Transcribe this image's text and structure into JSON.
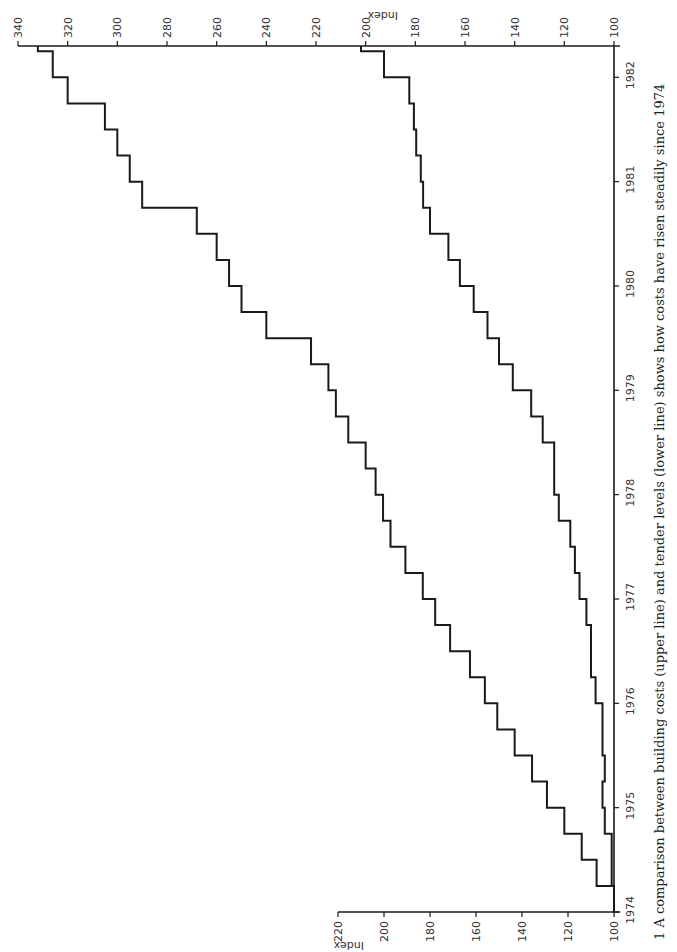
{
  "chart_data": {
    "type": "line",
    "step": true,
    "orientation": "rotated-90-ccw",
    "title": "",
    "caption": "1 A comparison between building costs (upper line) and tender levels (lower line) shows how costs have risen steadily since 1974",
    "xlabel": "",
    "ylabel": "Index",
    "x_ticks": [
      "1974",
      "1975",
      "1976",
      "1977",
      "1978",
      "1979",
      "1980",
      "1981",
      "1982"
    ],
    "upper_axis": {
      "label": "Index",
      "range": [
        100,
        340
      ],
      "ticks": [
        100,
        120,
        140,
        160,
        180,
        200,
        220,
        240,
        260,
        280,
        300,
        320,
        340
      ]
    },
    "lower_axis": {
      "label": "Index",
      "range": [
        100,
        220
      ],
      "ticks": [
        100,
        120,
        140,
        160,
        180,
        200,
        220
      ]
    },
    "x": [
      1974.0,
      1974.25,
      1974.5,
      1974.75,
      1975.0,
      1975.25,
      1975.5,
      1975.75,
      1976.0,
      1976.25,
      1976.5,
      1976.75,
      1977.0,
      1977.25,
      1977.5,
      1977.75,
      1978.0,
      1978.25,
      1978.5,
      1978.75,
      1979.0,
      1979.25,
      1979.5,
      1979.75,
      1980.0,
      1980.25,
      1980.5,
      1980.75,
      1981.0,
      1981.25,
      1981.5,
      1981.75,
      1982.0,
      1982.25
    ],
    "series": [
      {
        "name": "Building costs (upper line)",
        "scale": "upper_axis",
        "values": [
          100,
          107,
          113,
          120,
          127,
          133,
          140,
          147,
          152,
          158,
          166,
          172,
          177,
          184,
          190,
          193,
          196,
          200,
          207,
          212,
          215,
          222,
          240,
          250,
          255,
          260,
          268,
          290,
          295,
          300,
          305,
          320,
          326,
          332
        ]
      },
      {
        "name": "Tender levels (lower line)",
        "scale": "lower_axis",
        "values": [
          100,
          101,
          101,
          104,
          105,
          104,
          105,
          105,
          108,
          110,
          110,
          112,
          115,
          117,
          119,
          124,
          126,
          126,
          131,
          136,
          144,
          150,
          155,
          161,
          167,
          172,
          180,
          183,
          184,
          186,
          187,
          189,
          200,
          210
        ]
      }
    ],
    "grid": false,
    "legend": "none"
  },
  "axes": {
    "upper_label": "Index",
    "lower_label": "Index"
  },
  "caption": "1 A comparison between building costs (upper line) and tender levels (lower line) shows how costs have risen steadily since 1974"
}
